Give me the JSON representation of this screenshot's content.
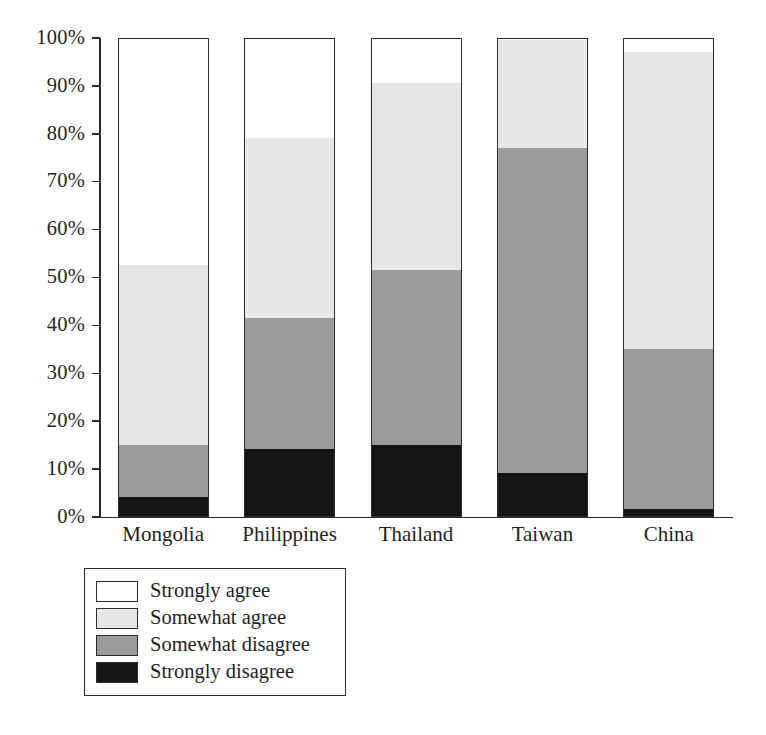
{
  "chart_data": {
    "type": "bar",
    "subtype": "stacked-percentage",
    "title": "",
    "xlabel": "",
    "ylabel": "",
    "ylim": [
      0,
      100
    ],
    "grid": false,
    "legend_position": "below-left",
    "categories": [
      "Mongolia",
      "Philippines",
      "Thailand",
      "Taiwan",
      "China"
    ],
    "y_ticks": [
      "0%",
      "10%",
      "20%",
      "30%",
      "40%",
      "50%",
      "60%",
      "70%",
      "80%",
      "90%",
      "100%"
    ],
    "y_tick_values": [
      0,
      10,
      20,
      30,
      40,
      50,
      60,
      70,
      80,
      90,
      100
    ],
    "series": [
      {
        "name": "Strongly agree",
        "color": "#ffffff",
        "values": [
          47.5,
          21.0,
          9.5,
          0.5,
          3.0
        ]
      },
      {
        "name": "Somewhat agree",
        "color": "#e7e7e7",
        "values": [
          37.5,
          37.5,
          39.0,
          22.5,
          62.0
        ]
      },
      {
        "name": "Somewhat disagree",
        "color": "#9b9b9b",
        "values": [
          11.0,
          27.5,
          36.5,
          68.0,
          33.5
        ]
      },
      {
        "name": "Strongly disagree",
        "color": "#151515",
        "values": [
          4.0,
          14.0,
          15.0,
          9.0,
          1.5
        ]
      }
    ],
    "cumulative_tops": {
      "Mongolia": [
        100.0,
        52.5,
        15.0,
        4.0
      ],
      "Philippines": [
        100.0,
        79.0,
        41.5,
        14.0
      ],
      "Thailand": [
        100.0,
        90.5,
        51.5,
        15.0
      ],
      "Taiwan": [
        100.0,
        99.5,
        77.0,
        9.0
      ],
      "China": [
        100.0,
        97.0,
        35.0,
        1.5
      ]
    }
  },
  "legend": {
    "items": [
      {
        "label": "Strongly agree",
        "swatch": "#ffffff"
      },
      {
        "label": "Somewhat agree",
        "swatch": "#e7e7e7"
      },
      {
        "label": "Somewhat disagree",
        "swatch": "#9b9b9b"
      },
      {
        "label": "Strongly disagree",
        "swatch": "#151515"
      }
    ]
  },
  "colors": {
    "axis": "#2b2b2b",
    "text": "#1f1f1f",
    "background": "#ffffff"
  }
}
